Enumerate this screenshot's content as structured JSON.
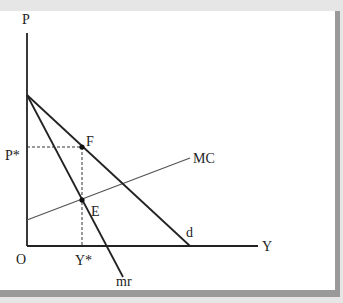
{
  "diagram": {
    "axes": {
      "y_label": "P",
      "x_label": "Y",
      "origin_label": "O"
    },
    "curves": [
      {
        "id": "d",
        "label": "d",
        "description": "demand curve"
      },
      {
        "id": "mr",
        "label": "mr",
        "description": "marginal revenue curve"
      },
      {
        "id": "MC",
        "label": "MC",
        "description": "marginal cost curve"
      }
    ],
    "points": [
      {
        "id": "F",
        "label": "F",
        "description": "price on demand curve at Y*"
      },
      {
        "id": "E",
        "label": "E",
        "description": "mr = MC intersection"
      }
    ],
    "ticks": {
      "price": "P*",
      "quantity": "Y*"
    },
    "colors": {
      "background": "#ffffff",
      "frame": "#9a9a9a",
      "outer": "#e4e4e4",
      "line": "#222222",
      "mc_line": "#555555"
    }
  }
}
